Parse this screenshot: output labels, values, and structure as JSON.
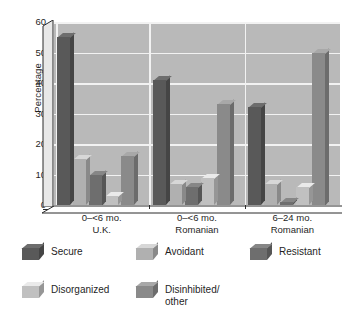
{
  "chart_data": {
    "type": "bar",
    "title": "",
    "subtitle": "",
    "xlabel": "",
    "ylabel": "Percentage",
    "ylim": [
      0,
      60
    ],
    "yticks": [
      0,
      10,
      20,
      30,
      40,
      50,
      60
    ],
    "ytick_labels": [
      "0",
      "10",
      "20",
      "30",
      "40",
      "50",
      "60"
    ],
    "grid": "horizontal-and-vertical",
    "grid_color": "#f2f2f2",
    "plot_background": "#b9b9b9",
    "legend_position": "bottom",
    "style": "3d-grayscale",
    "categories": [
      "0–<6 mo. U.K.",
      "0–<6 mo. Romanian",
      "6–24 mo. Romanian"
    ],
    "category_lines": [
      [
        "0–<6 mo.",
        "U.K."
      ],
      [
        "0–<6 mo.",
        "Romanian"
      ],
      [
        "6–24 mo.",
        "Romanian"
      ]
    ],
    "series": [
      {
        "name": "Secure",
        "color": "#595959",
        "values": [
          55,
          41,
          32
        ]
      },
      {
        "name": "Avoidant",
        "color": "#b0b0b0",
        "values": [
          15,
          7,
          7
        ]
      },
      {
        "name": "Resistant",
        "color": "#6e6e6e",
        "values": [
          10,
          6,
          1
        ]
      },
      {
        "name": "Disorganized",
        "color": "#c0c0c0",
        "values": [
          3,
          9,
          6
        ]
      },
      {
        "name": "Disinhibited/\nother",
        "color": "#8a8a8a",
        "values": [
          16,
          33,
          50
        ]
      }
    ]
  },
  "legend": {
    "items": [
      {
        "label": "Secure"
      },
      {
        "label": "Avoidant"
      },
      {
        "label": "Resistant"
      },
      {
        "label": "Disorganized"
      },
      {
        "label": "Disinhibited/\nother"
      }
    ]
  },
  "axis": {
    "y_title": "Percentage"
  }
}
